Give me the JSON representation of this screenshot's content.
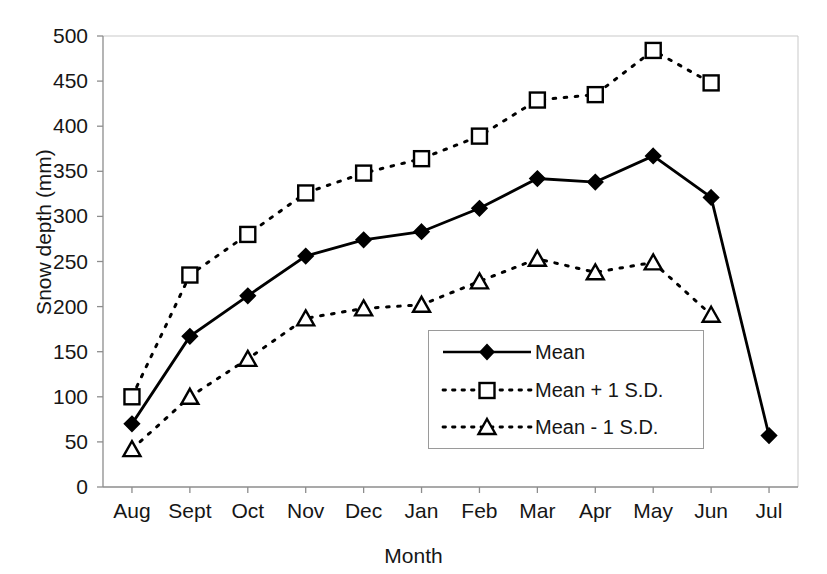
{
  "chart_data": {
    "type": "line",
    "title": "",
    "xlabel": "Month",
    "ylabel": "Snow depth (mm)",
    "categories": [
      "Aug",
      "Sept",
      "Oct",
      "Nov",
      "Dec",
      "Jan",
      "Feb",
      "Mar",
      "Apr",
      "May",
      "Jun",
      "Jul"
    ],
    "ylim": [
      0,
      500
    ],
    "yticks": [
      0,
      50,
      100,
      150,
      200,
      250,
      300,
      350,
      400,
      450,
      500
    ],
    "grid": false,
    "legend_position": "inside-center-right",
    "series": [
      {
        "name": "Mean",
        "marker": "filled-diamond",
        "line": "solid",
        "color": "#000000",
        "values": [
          70,
          167,
          212,
          256,
          274,
          283,
          309,
          342,
          338,
          367,
          321,
          57
        ]
      },
      {
        "name": "Mean + 1 S.D.",
        "marker": "open-square",
        "line": "dotted",
        "color": "#000000",
        "values": [
          100,
          235,
          280,
          326,
          348,
          364,
          389,
          429,
          435,
          484,
          448,
          null
        ]
      },
      {
        "name": "Mean - 1 S.D.",
        "marker": "open-triangle",
        "line": "dotted",
        "color": "#000000",
        "values": [
          42,
          100,
          142,
          187,
          198,
          202,
          228,
          253,
          238,
          249,
          191,
          null
        ]
      }
    ]
  },
  "legend": {
    "items": [
      {
        "label": "Mean"
      },
      {
        "label": "Mean + 1 S.D."
      },
      {
        "label": "Mean - 1 S.D."
      }
    ]
  }
}
